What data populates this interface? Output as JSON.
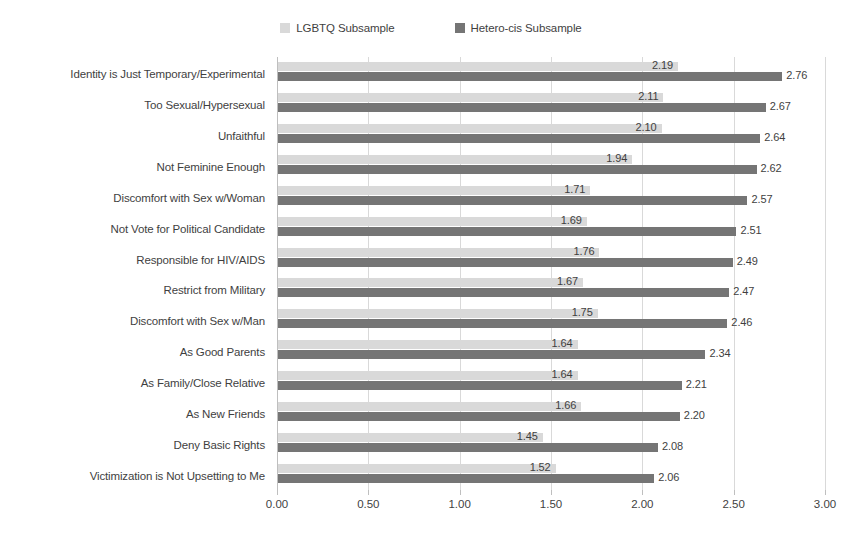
{
  "chart_data": {
    "type": "bar",
    "orientation": "horizontal",
    "title": "",
    "xlabel": "",
    "ylabel": "",
    "xlim": [
      0.0,
      3.0
    ],
    "xticks": [
      "0.00",
      "0.50",
      "1.00",
      "1.50",
      "2.00",
      "2.50",
      "3.00"
    ],
    "xtick_values": [
      0.0,
      0.5,
      1.0,
      1.5,
      2.0,
      2.5,
      3.0
    ],
    "grid": "vertical",
    "legend_position": "top-center",
    "categories": [
      "Identity is Just Temporary/Experimental",
      "Too Sexual/Hypersexual",
      "Unfaithful",
      "Not Feminine Enough",
      "Discomfort with Sex w/Woman",
      "Not Vote for Political Candidate",
      "Responsible for HIV/AIDS",
      "Restrict from Military",
      "Discomfort with Sex w/Man",
      "As Good Parents",
      "As Family/Close Relative",
      "As New Friends",
      "Deny Basic Rights",
      "Victimization is Not Upsetting to Me"
    ],
    "series": [
      {
        "name": "LGBTQ Subsample",
        "color": "#d9d9d9",
        "values": [
          2.19,
          2.11,
          2.1,
          1.94,
          1.71,
          1.69,
          1.76,
          1.67,
          1.75,
          1.64,
          1.64,
          1.66,
          1.45,
          1.52
        ],
        "labels": [
          "2.19",
          "2.11",
          "2.10",
          "1.94",
          "1.71",
          "1.69",
          "1.76",
          "1.67",
          "1.75",
          "1.64",
          "1.64",
          "1.66",
          "1.45",
          "1.52"
        ]
      },
      {
        "name": "Hetero-cis Subsample",
        "color": "#757575",
        "values": [
          2.76,
          2.67,
          2.64,
          2.62,
          2.57,
          2.51,
          2.49,
          2.47,
          2.46,
          2.34,
          2.21,
          2.2,
          2.08,
          2.06
        ],
        "labels": [
          "2.76",
          "2.67",
          "2.64",
          "2.62",
          "2.57",
          "2.51",
          "2.49",
          "2.47",
          "2.46",
          "2.34",
          "2.21",
          "2.20",
          "2.08",
          "2.06"
        ]
      }
    ]
  },
  "legend": {
    "items": [
      {
        "label": "LGBTQ Subsample",
        "color": "#d9d9d9"
      },
      {
        "label": "Hetero-cis Subsample",
        "color": "#757575"
      }
    ]
  }
}
